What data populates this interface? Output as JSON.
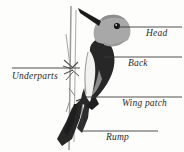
{
  "figure": {
    "background_color": "#fdfdfc"
  },
  "colors": {
    "head_gray": "#a8a8a8",
    "body_dark": "#272727",
    "underpart_light": "#f2f2f0",
    "leader_line": "#3a3a3a",
    "branch": "#8f8f8f",
    "text": "#2b2b2b"
  },
  "labels": {
    "head": "Head",
    "back": "Back",
    "wing_patch": "Wing patch",
    "underparts": "Underparts",
    "rump": "Rump"
  },
  "leaders": [
    {
      "name": "head",
      "type": "horizontal",
      "x1": 118,
      "y1": 27,
      "x2": 182,
      "y2": 27
    },
    {
      "name": "back",
      "type": "horizontal",
      "x1": 104,
      "y1": 57,
      "x2": 182,
      "y2": 57
    },
    {
      "name": "wing_patch",
      "type": "horizontal",
      "x1": 86,
      "y1": 97,
      "x2": 182,
      "y2": 97
    },
    {
      "name": "underparts",
      "type": "horizontal",
      "x1": 12,
      "y1": 68,
      "x2": 80,
      "y2": 68
    },
    {
      "name": "rump",
      "type": "elbow",
      "x1": 82,
      "y1": 104,
      "x2": 82,
      "y2": 131,
      "x3": 158,
      "y3": 131
    }
  ]
}
